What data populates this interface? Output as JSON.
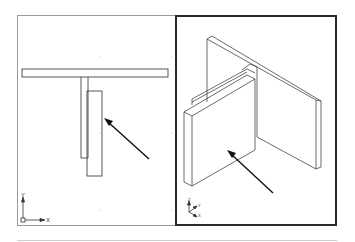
{
  "viewports": [
    {
      "name": "top-view",
      "active": false,
      "ucs": {
        "x_label": "X",
        "y_label": "Y"
      }
    },
    {
      "name": "isometric-view",
      "active": true,
      "ucs": {
        "labels": [
          "Z",
          "Y",
          "X"
        ]
      }
    }
  ],
  "colors": {
    "active_border": "#2a2a2a",
    "inactive_border": "#9a9a9a",
    "line": "#333333",
    "arrow": "#111111"
  }
}
